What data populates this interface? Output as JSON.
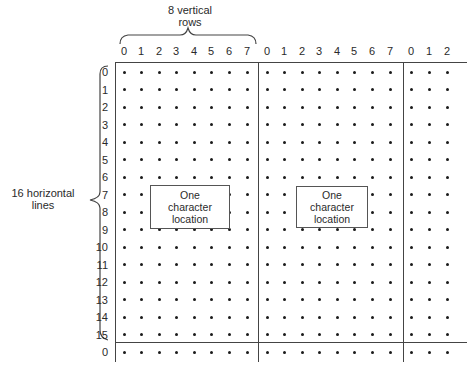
{
  "labels": {
    "vertical_rows": "8 vertical\nrows",
    "vertical_rows_line1": "8 vertical",
    "vertical_rows_line2": "rows",
    "horizontal_lines_line1": "16 horizontal",
    "horizontal_lines_line2": "lines"
  },
  "column_headers": [
    "0",
    "1",
    "2",
    "3",
    "4",
    "5",
    "6",
    "7",
    "0",
    "1",
    "2",
    "3",
    "4",
    "5",
    "6",
    "7",
    "0",
    "1",
    "2"
  ],
  "row_headers": [
    "0",
    "1",
    "2",
    "3",
    "4",
    "5",
    "6",
    "7",
    "8",
    "9",
    "10",
    "11",
    "12",
    "13",
    "14",
    "15",
    "0"
  ],
  "boxes": [
    {
      "line1": "One",
      "line2": "character",
      "line3": "location"
    },
    {
      "line1": "One",
      "line2": "character",
      "line3": "location"
    }
  ],
  "colors": {
    "dot": "#1a1a1a",
    "line": "#444444",
    "text": "#2a2a2a"
  }
}
